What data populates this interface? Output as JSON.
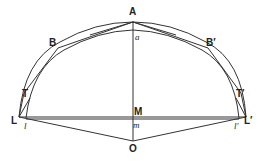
{
  "diagram": {
    "type": "geometry",
    "points": {
      "A": "A",
      "a": "a",
      "B": "B",
      "B_prime": "B′",
      "T": "T",
      "T_prime": "T′",
      "L": "L",
      "L_prime": "L′",
      "l": "l",
      "l_prime": "l′",
      "M": "M",
      "m": "m",
      "O": "O"
    },
    "colors": {
      "stroke": "#333333",
      "background": "#ffffff"
    }
  }
}
